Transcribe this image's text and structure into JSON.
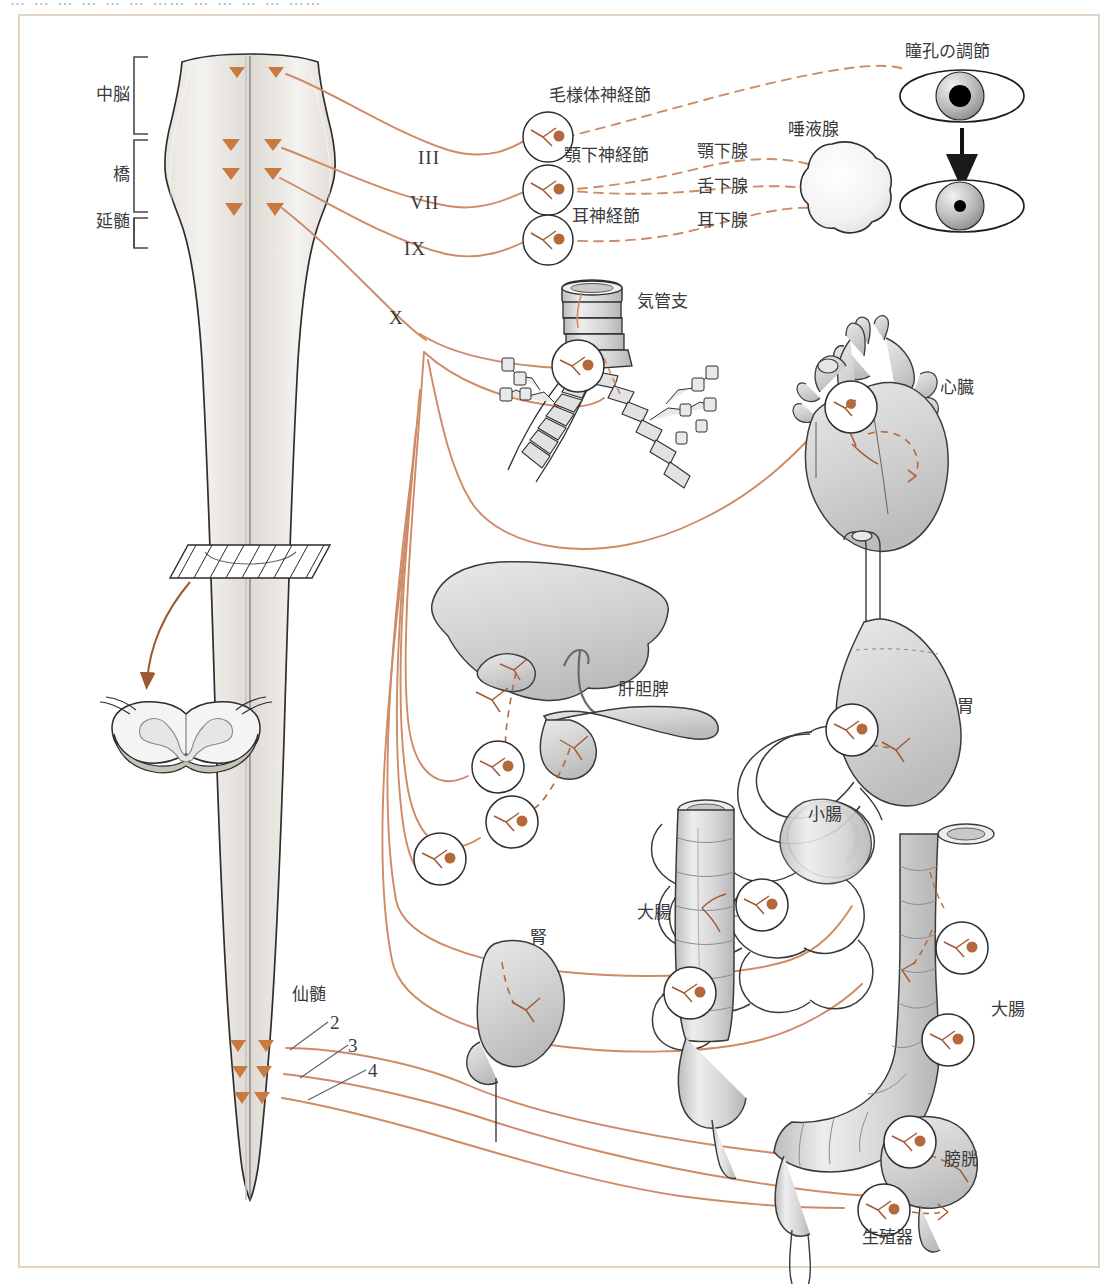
{
  "page": {
    "top_fragments": [
      "… …  …    … … …  ……   …  …  … …   ……"
    ],
    "frame_color": "#e3d4c6",
    "nerve_color": "#cf8a66",
    "marker_color": "#c87a41",
    "ganglion_dot_color": "#b5693a",
    "organ_fill": "#d9d9d9",
    "organ_stroke": "#3f3f3f",
    "text_color": "#3a3a3c"
  },
  "brainstem": {
    "labels": [
      {
        "id": "midbrain",
        "text": "中脳"
      },
      {
        "id": "pons",
        "text": "橋"
      },
      {
        "id": "medulla",
        "text": "延髄"
      }
    ]
  },
  "cranial_nerves": [
    {
      "id": "cn3",
      "numeral": "III"
    },
    {
      "id": "cn7",
      "numeral": "VII"
    },
    {
      "id": "cn9",
      "numeral": "IX"
    },
    {
      "id": "cn10",
      "numeral": "X"
    }
  ],
  "ganglia": [
    {
      "id": "ciliary",
      "text": "毛様体神経節"
    },
    {
      "id": "submandibular",
      "text": "顎下神経節"
    },
    {
      "id": "otic",
      "text": "耳神経節"
    }
  ],
  "glands": [
    {
      "id": "submandibular-gland",
      "text": "顎下腺"
    },
    {
      "id": "sublingual-gland",
      "text": "舌下腺"
    },
    {
      "id": "parotid-gland",
      "text": "耳下腺"
    }
  ],
  "organs": [
    {
      "id": "salivary-gland",
      "text": "唾液腺"
    },
    {
      "id": "pupil-regulation",
      "text": "瞳孔の調節"
    },
    {
      "id": "bronchi",
      "text": "気管支"
    },
    {
      "id": "heart",
      "text": "心臓"
    },
    {
      "id": "hepatobiliary-pancreas",
      "text": "肝胆脾"
    },
    {
      "id": "stomach",
      "text": "胃"
    },
    {
      "id": "small-intestine",
      "text": "小腸"
    },
    {
      "id": "kidney",
      "text": "腎"
    },
    {
      "id": "large-intestine-left",
      "text": "大腸"
    },
    {
      "id": "large-intestine-right",
      "text": "大腸"
    },
    {
      "id": "bladder",
      "text": "膀胱"
    },
    {
      "id": "genitals",
      "text": "生殖器"
    }
  ],
  "sacral": {
    "label": "仙髄",
    "segments": [
      "2",
      "3",
      "4"
    ]
  }
}
